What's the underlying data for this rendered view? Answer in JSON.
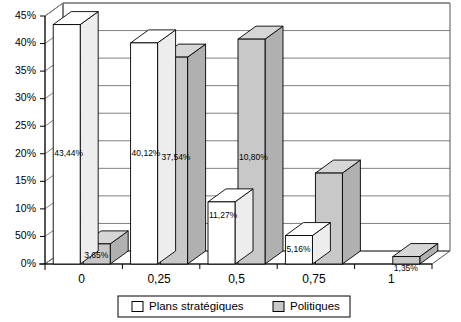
{
  "chart_data": {
    "type": "bar",
    "title": "",
    "subtitle": "",
    "xlabel": "",
    "ylabel": "",
    "categories": [
      "0",
      "0,25",
      "0,5",
      "0,75",
      "1"
    ],
    "ylim": [
      0,
      45
    ],
    "ytick_labels": [
      "45%",
      "40%",
      "35%",
      "30%",
      "25%",
      "20%",
      "15%",
      "10%",
      "50%",
      "0%"
    ],
    "ytick_values": [
      45,
      40,
      35,
      30,
      25,
      20,
      15,
      10,
      5,
      0
    ],
    "grid": true,
    "legend_position": "bottom",
    "style": "3d-grouped-columns",
    "series": [
      {
        "name": "Plans stratégiques",
        "color": "#ffffff",
        "values": [
          43.44,
          40.12,
          11.27,
          5.16,
          0
        ],
        "data_labels": [
          "43,44%",
          "40,12%",
          "11,27%",
          "5,16%",
          ""
        ]
      },
      {
        "name": "Politiques",
        "color": "#c8c8c8",
        "values": [
          3.65,
          37.54,
          40.8,
          16.5,
          1.35
        ],
        "data_labels": [
          "3,65%",
          "37,54%",
          "10,80%",
          "",
          "1,35%"
        ]
      }
    ]
  },
  "legend": {
    "entries": [
      {
        "label": "Plans stratégiques",
        "color": "#ffffff"
      },
      {
        "label": "Politiques",
        "color": "#c8c8c8"
      }
    ]
  },
  "colors": {
    "series_white": "#ffffff",
    "series_gray": "#c8c8c8",
    "gray_top": "#d6d6d6",
    "gray_side": "#b0b0b0",
    "white_top": "#ffffff",
    "white_side": "#ededed",
    "axis": "#000000",
    "grid": "#808080",
    "background": "#ffffff"
  }
}
